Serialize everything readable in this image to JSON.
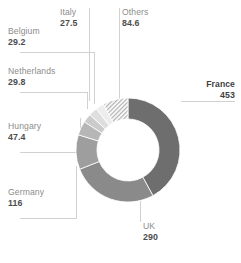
{
  "chart_data": {
    "type": "pie",
    "variant": "donut",
    "title": "",
    "subtitle": "",
    "xlabel": "",
    "ylabel": "",
    "grid": false,
    "legend": "none",
    "labels_position": "outside-with-leader-lines",
    "start_angle_deg": 0,
    "direction": "clockwise",
    "total": 1077.5,
    "categories": [
      "France",
      "UK",
      "Germany",
      "Hungary",
      "Netherlands",
      "Belgium",
      "Italy",
      "Others"
    ],
    "values": [
      453,
      290,
      116,
      47.4,
      29.8,
      29.2,
      27.5,
      84.6
    ],
    "value_labels": [
      "453",
      "290",
      "116",
      "47.4",
      "29.8",
      "29.2",
      "27.5",
      "84.6"
    ],
    "colors": [
      "#6e6e6e",
      "#8a8a8a",
      "#9e9e9e",
      "#b6b6b6",
      "#cbcbcb",
      "#dedede",
      "#ededed",
      "#ffffff"
    ],
    "slices": [
      {
        "label": "France",
        "value": 453,
        "value_text": "453",
        "color": "#6e6e6e",
        "pattern": "solid",
        "emphasis": true
      },
      {
        "label": "UK",
        "value": 290,
        "value_text": "290",
        "color": "#8a8a8a",
        "pattern": "solid",
        "emphasis": false
      },
      {
        "label": "Germany",
        "value": 116,
        "value_text": "116",
        "color": "#9e9e9e",
        "pattern": "solid",
        "emphasis": false
      },
      {
        "label": "Hungary",
        "value": 47.4,
        "value_text": "47.4",
        "color": "#b6b6b6",
        "pattern": "solid",
        "emphasis": false
      },
      {
        "label": "Netherlands",
        "value": 29.8,
        "value_text": "29.8",
        "color": "#cbcbcb",
        "pattern": "solid",
        "emphasis": false
      },
      {
        "label": "Belgium",
        "value": 29.2,
        "value_text": "29.2",
        "color": "#dedede",
        "pattern": "solid",
        "emphasis": false
      },
      {
        "label": "Italy",
        "value": 27.5,
        "value_text": "27.5",
        "color": "#ededed",
        "pattern": "solid",
        "emphasis": false
      },
      {
        "label": "Others",
        "value": 84.6,
        "value_text": "84.6",
        "color": "#ffffff",
        "pattern": "diagonal-hatch",
        "emphasis": false
      }
    ]
  },
  "labels": {
    "italy": {
      "name": "Italy",
      "value": "27.5"
    },
    "others": {
      "name": "Others",
      "value": "84.6"
    },
    "belgium": {
      "name": "Belgium",
      "value": "29.2"
    },
    "netherlands": {
      "name": "Netherlands",
      "value": "29.8"
    },
    "hungary": {
      "name": "Hungary",
      "value": "47.4"
    },
    "germany": {
      "name": "Germany",
      "value": "116"
    },
    "uk": {
      "name": "UK",
      "value": "290"
    },
    "france": {
      "name": "France",
      "value": "453"
    }
  },
  "style": {
    "background": "#ffffff",
    "leader_line_color": "#cccccc",
    "label_name_color": "#8c8c8c",
    "label_value_color": "#4d4d4d",
    "emphasis_color": "#3f3f3f"
  }
}
